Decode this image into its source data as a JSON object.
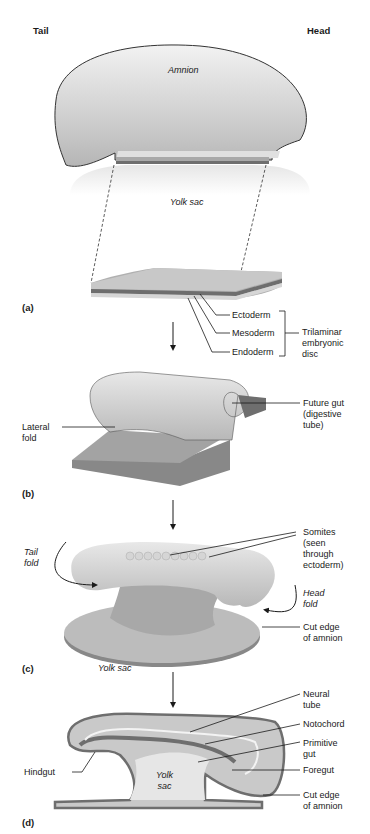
{
  "header": {
    "orientation_left": "Tail",
    "orientation_right": "Head",
    "clipped_caption": "(continued, partially cropped)"
  },
  "panel_a": {
    "label": "(a)",
    "amnion": "Amnion",
    "yolk_sac": "Yolk sac",
    "layers": [
      "Ectoderm",
      "Mesoderm",
      "Endoderm"
    ],
    "group_label": "Trilaminar\nembryonic\ndisc"
  },
  "panel_b": {
    "label": "(b)",
    "lateral_fold": "Lateral\nfold",
    "future_gut": "Future gut\n(digestive\ntube)"
  },
  "panel_c": {
    "label": "(c)",
    "tail_fold": "Tail\nfold",
    "head_fold": "Head\nfold",
    "somites": "Somites\n(seen\nthrough\nectoderm)",
    "cut_edge": "Cut edge\nof amnion",
    "yolk_sac": "Yolk sac"
  },
  "panel_d": {
    "label": "(d)",
    "neural_tube": "Neural\ntube",
    "notochord": "Notochord",
    "primitive_gut": "Primitive\ngut",
    "foregut": "Foregut",
    "hindgut": "Hindgut",
    "yolk_sac": "Yolk\nsac",
    "cut_edge": "Cut edge\nof amnion"
  },
  "colors": {
    "ectoderm": "#a9a9a9",
    "mesoderm": "#6e6e6e",
    "endoderm": "#d6d6d6",
    "outline": "#3a3a3a"
  }
}
